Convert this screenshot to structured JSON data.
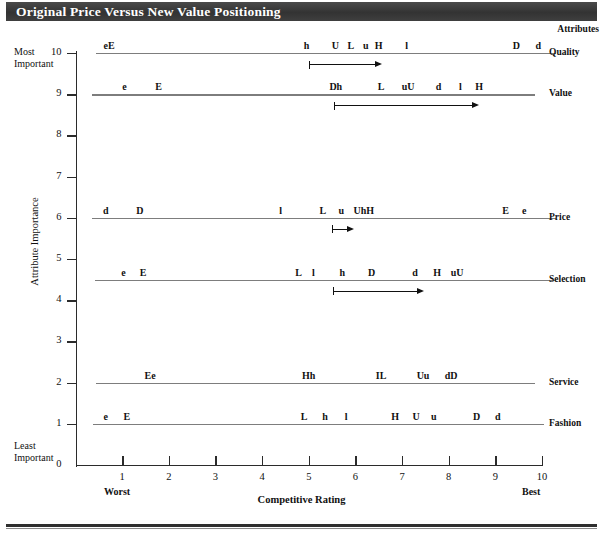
{
  "title": "Original Price Versus New Value Positioning",
  "attributes_header": "Attributes",
  "axes": {
    "y_title": "Attribute Importance",
    "x_title": "Competitive Rating",
    "y_ticks": [
      "0",
      "1",
      "2",
      "3",
      "4",
      "5",
      "6",
      "7",
      "8",
      "9",
      "10"
    ],
    "x_ticks": [
      "0",
      "1",
      "2",
      "3",
      "4",
      "5",
      "6",
      "7",
      "8",
      "9",
      "10"
    ],
    "y_top_note_line1": "Most",
    "y_top_note_line2": "Important",
    "y_bottom_note_line1": "Least",
    "y_bottom_note_line2": "Important",
    "x_left_note": "Worst",
    "x_right_note": "Best",
    "x_min": 0,
    "x_max": 10,
    "y_min": 0,
    "y_max": 10
  },
  "chart_data": {
    "type": "scatter",
    "title": "Original Price Versus New Value Positioning",
    "xlabel": "Competitive Rating",
    "ylabel": "Attribute Importance",
    "xlim": [
      0,
      10
    ],
    "ylim": [
      0,
      10
    ],
    "grid": false,
    "legend": "none",
    "x_axis_annotations": {
      "left": "Worst",
      "right": "Best"
    },
    "y_axis_annotations": {
      "top": "Most Important",
      "bottom": "Least Important"
    },
    "series": [
      {
        "name": "Quality",
        "importance": 10,
        "line_from": 0.45,
        "line_to": 10.0,
        "markers": [
          {
            "label": "eE",
            "x": 0.72
          },
          {
            "label": "h",
            "x": 4.95
          },
          {
            "label": "U",
            "x": 5.57
          },
          {
            "label": "L",
            "x": 5.9
          },
          {
            "label": "u",
            "x": 6.22
          },
          {
            "label": "H",
            "x": 6.5
          },
          {
            "label": "l",
            "x": 7.1
          },
          {
            "label": "D",
            "x": 9.45
          },
          {
            "label": "d",
            "x": 9.92
          }
        ],
        "shift_arrow": {
          "from": 5.0,
          "to": 6.55
        }
      },
      {
        "name": "Value",
        "importance": 9,
        "line_from": 0.35,
        "line_to": 9.55,
        "markers": [
          {
            "label": "e",
            "x": 1.05
          },
          {
            "label": "E",
            "x": 1.78
          },
          {
            "label": "Dh",
            "x": 5.58
          },
          {
            "label": "L",
            "x": 6.55
          },
          {
            "label": "uU",
            "x": 7.13
          },
          {
            "label": "d",
            "x": 7.78
          },
          {
            "label": "l",
            "x": 8.25
          },
          {
            "label": "H",
            "x": 8.65
          }
        ],
        "shift_arrow": {
          "from": 5.55,
          "to": 8.62
        }
      },
      {
        "name": "Price",
        "importance": 6,
        "line_from": 0.35,
        "line_to": 10.0,
        "markers": [
          {
            "label": "d",
            "x": 0.65
          },
          {
            "label": "D",
            "x": 1.38
          },
          {
            "label": "l",
            "x": 4.4
          },
          {
            "label": "L",
            "x": 5.3
          },
          {
            "label": "u",
            "x": 5.7
          },
          {
            "label": "UhH",
            "x": 6.18
          },
          {
            "label": "E",
            "x": 9.22
          },
          {
            "label": "e",
            "x": 9.62
          }
        ],
        "shift_arrow": {
          "from": 5.5,
          "to": 5.95
        }
      },
      {
        "name": "Selection",
        "importance": 4.5,
        "line_from": 0.42,
        "line_to": 10.0,
        "markers": [
          {
            "label": "e",
            "x": 1.03
          },
          {
            "label": "E",
            "x": 1.45
          },
          {
            "label": "L",
            "x": 4.78
          },
          {
            "label": "l",
            "x": 5.1
          },
          {
            "label": "h",
            "x": 5.72
          },
          {
            "label": "D",
            "x": 6.35
          },
          {
            "label": "d",
            "x": 7.28
          },
          {
            "label": "H",
            "x": 7.75
          },
          {
            "label": "uU",
            "x": 8.18
          }
        ],
        "shift_arrow": {
          "from": 5.52,
          "to": 7.45
        }
      },
      {
        "name": "Service",
        "importance": 2,
        "line_from": 0.45,
        "line_to": 9.55,
        "markers": [
          {
            "label": "Ee",
            "x": 1.6
          },
          {
            "label": "Hh",
            "x": 5.0
          },
          {
            "label": "IL",
            "x": 6.55
          },
          {
            "label": "Uu",
            "x": 7.45
          },
          {
            "label": "dD",
            "x": 8.05
          }
        ],
        "shift_arrow": null
      },
      {
        "name": "Fashion",
        "importance": 1,
        "line_from": 0.38,
        "line_to": 9.75,
        "markers": [
          {
            "label": "e",
            "x": 0.65
          },
          {
            "label": "E",
            "x": 1.1
          },
          {
            "label": "L",
            "x": 4.9
          },
          {
            "label": "h",
            "x": 5.35
          },
          {
            "label": "l",
            "x": 5.8
          },
          {
            "label": "H",
            "x": 6.85
          },
          {
            "label": "U",
            "x": 7.3
          },
          {
            "label": "u",
            "x": 7.68
          },
          {
            "label": "D",
            "x": 8.6
          },
          {
            "label": "d",
            "x": 9.05
          }
        ],
        "shift_arrow": null
      }
    ]
  }
}
